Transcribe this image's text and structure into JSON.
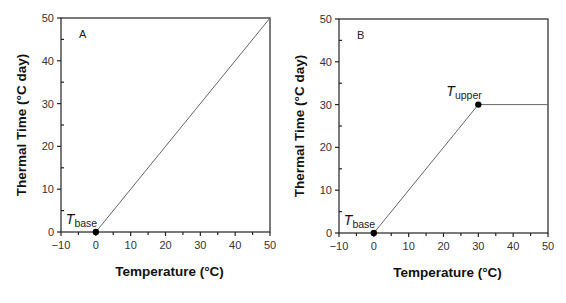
{
  "colors": {
    "axis": "#222222",
    "line": "#666666",
    "marker": "#000000",
    "background": "#ffffff"
  },
  "chart_data": [
    {
      "type": "line",
      "panel": "A",
      "title": "",
      "panel_label": "A",
      "xlabel": "Temperature (°C)",
      "ylabel": "Thermal Time (°C day)",
      "xlim": [
        -10,
        50
      ],
      "ylim": [
        0,
        50
      ],
      "xticks": [
        -10,
        0,
        10,
        20,
        30,
        40,
        50
      ],
      "xtick_labels": [
        "−10",
        "0",
        "10",
        "20",
        "30",
        "40",
        "50"
      ],
      "yticks": [
        0,
        10,
        20,
        30,
        40,
        50
      ],
      "ytick_labels": [
        "0",
        "10",
        "20",
        "30",
        "40",
        "50"
      ],
      "grid": false,
      "series": [
        {
          "name": "thermal time",
          "x": [
            0,
            50
          ],
          "y": [
            0,
            50
          ]
        }
      ],
      "markers": [
        {
          "label": "T",
          "sub": "base",
          "x": 0,
          "y": 0
        }
      ],
      "plot_box": {
        "left": 61,
        "right": 270,
        "top": 18,
        "bottom": 232
      }
    },
    {
      "type": "line",
      "panel": "B",
      "title": "",
      "panel_label": "B",
      "xlabel": "Temperature (°C)",
      "ylabel": "Thermal Time (°C day)",
      "xlim": [
        -10,
        50
      ],
      "ylim": [
        0,
        50
      ],
      "xticks": [
        -10,
        0,
        10,
        20,
        30,
        40,
        50
      ],
      "xtick_labels": [
        "−10",
        "0",
        "10",
        "20",
        "30",
        "40",
        "50"
      ],
      "yticks": [
        0,
        10,
        20,
        30,
        40,
        50
      ],
      "ytick_labels": [
        "0",
        "10",
        "20",
        "30",
        "40",
        "50"
      ],
      "grid": false,
      "series": [
        {
          "name": "thermal time",
          "x": [
            0,
            30,
            50
          ],
          "y": [
            0,
            30,
            30
          ]
        }
      ],
      "markers": [
        {
          "label": "T",
          "sub": "base",
          "x": 0,
          "y": 0
        },
        {
          "label": "T",
          "sub": "upper",
          "x": 30,
          "y": 30
        }
      ],
      "plot_box": {
        "left": 339,
        "right": 548,
        "top": 19,
        "bottom": 233
      }
    }
  ]
}
